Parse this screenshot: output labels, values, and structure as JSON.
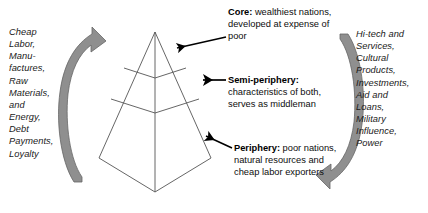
{
  "diagram": {
    "type": "concept-diagram",
    "background_color": "#ffffff",
    "line_color": "#555555",
    "arrow_fill": "#8f8f8f",
    "arrow_stroke": "#5f5f5f",
    "pointer_color": "#000000",
    "text_color": "#1a1a1a"
  },
  "flows": {
    "left": {
      "label": "Cheap Labor, Manu-\nfactures, Raw Materials, and Energy, Debt Payments, Loyalty",
      "text": "Cheap\nLabor,\nManu-\nfactures,\nRaw\nMaterials,\nand\nEnergy,\nDebt\nPayments,\nLoyalty",
      "direction": "upward",
      "arrow_name": "upward-flow-arrow"
    },
    "right": {
      "label": "Hi-tech and Services, Cultural Products, Investments, Aid and Loans, Military Influence, Power",
      "text": "Hi-tech and\nServices,\nCultural\nProducts,\nInvestments,\nAid and\nLoans,\nMilitary\nInfluence,\nPower",
      "direction": "downward",
      "arrow_name": "downward-flow-arrow"
    }
  },
  "pyramid": {
    "name": "world-systems-pyramid",
    "tiers": [
      {
        "id": "core",
        "term": "Core",
        "separator": ":",
        "description": " wealthiest nations, developed at expense of poor",
        "position": "top"
      },
      {
        "id": "semi-periphery",
        "term": "Semi-periphery",
        "separator": ":",
        "description": " characteristics of both, serves as middleman",
        "position": "middle"
      },
      {
        "id": "periphery",
        "term": "Periphery",
        "separator": ":",
        "description": " poor nations, natural resources and cheap labor exporters",
        "position": "bottom"
      }
    ]
  }
}
